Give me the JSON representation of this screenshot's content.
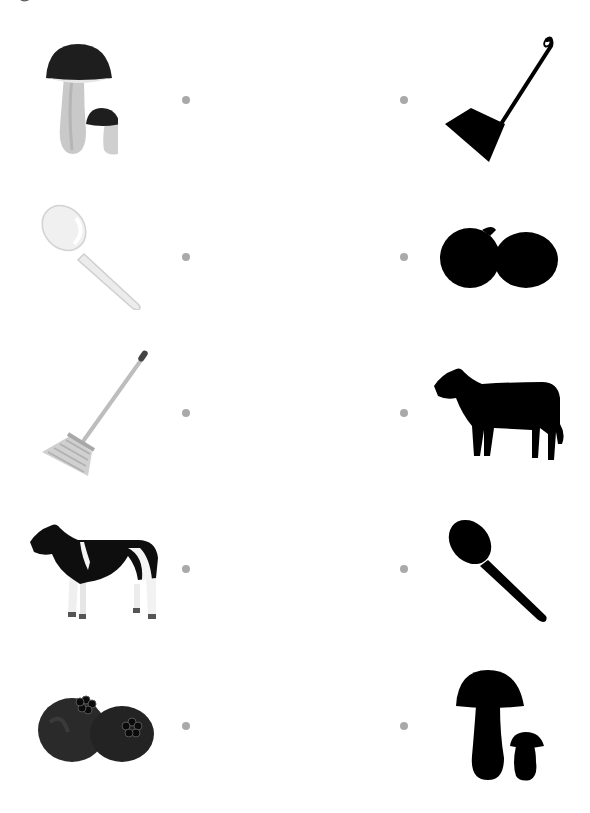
{
  "worksheet": {
    "type": "match-picture-to-shadow",
    "dot_color": "#a9a9a9",
    "rows": [
      {
        "left": "mushrooms",
        "right": "broom-silhouette"
      },
      {
        "left": "spoon",
        "right": "fruit-silhouette"
      },
      {
        "left": "broom",
        "right": "cow-silhouette"
      },
      {
        "left": "cow",
        "right": "spoon-silhouette"
      },
      {
        "left": "fruit",
        "right": "mushrooms-silhouette"
      }
    ]
  }
}
